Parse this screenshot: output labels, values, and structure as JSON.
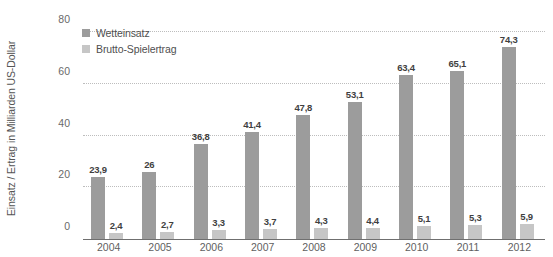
{
  "chart_data": {
    "type": "bar",
    "title": "",
    "subtitle": "",
    "xlabel": "",
    "ylabel": "Einsatz / Ertrag in Milliarden US-Dollar",
    "categories": [
      "2004",
      "2005",
      "2006",
      "2007",
      "2008",
      "2009",
      "2010",
      "2011",
      "2012"
    ],
    "series": [
      {
        "name": "Wetteinsatz",
        "color": "#9c9c9c",
        "values": [
          23.9,
          26,
          36.8,
          41.4,
          47.8,
          53.1,
          63.4,
          65.1,
          74.3
        ],
        "labels": [
          "23,9",
          "26",
          "36,8",
          "41,4",
          "47,8",
          "53,1",
          "63,4",
          "65,1",
          "74,3"
        ]
      },
      {
        "name": "Brutto-Spielertrag",
        "color": "#c6c6c6",
        "values": [
          2.4,
          2.7,
          3.3,
          3.7,
          4.3,
          4.4,
          5.1,
          5.3,
          5.9
        ],
        "labels": [
          "2,4",
          "2,7",
          "3,3",
          "3,7",
          "4,3",
          "4,4",
          "5,1",
          "5,3",
          "5,9"
        ]
      }
    ],
    "ylim": [
      0,
      80
    ],
    "yticks": [
      0,
      20,
      40,
      60,
      80
    ],
    "ytick_labels": [
      "0",
      "20",
      "40",
      "60",
      "80"
    ],
    "grid": true,
    "grid_style": "dotted",
    "legend_position": "top-left-inside",
    "decimal_separator": ","
  },
  "legend": {
    "items": [
      {
        "label": "Wetteinsatz"
      },
      {
        "label": "Brutto-Spielertrag"
      }
    ]
  },
  "axes": {
    "y_title": "Einsatz / Ertrag in Milliarden US-Dollar"
  }
}
